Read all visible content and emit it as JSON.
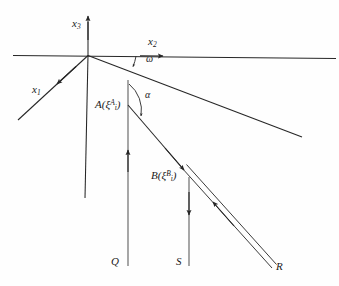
{
  "figure": {
    "background_color": "#fefefe",
    "line_color": "#262626",
    "text_color": "#1a1a1a"
  },
  "axes": [
    {
      "id": "x3",
      "name": "x3-axis",
      "label_base": "x",
      "label_sub": "3",
      "direction": "vertical-up",
      "label_x": 72,
      "label_y": 18,
      "arrow": "up"
    },
    {
      "id": "x2",
      "name": "x2-axis",
      "label_base": "x",
      "label_sub": "2",
      "direction": "horizontal-right",
      "label_x": 148,
      "label_y": 36,
      "arrow": "right"
    },
    {
      "id": "x1",
      "name": "x1-axis",
      "label_base": "x",
      "label_sub": "1",
      "direction": "down-left",
      "label_x": 32,
      "label_y": 84,
      "arrow": "down-left"
    }
  ],
  "angles": [
    {
      "id": "omega",
      "name": "omega-angle",
      "symbol": "ω",
      "label_x": 146,
      "label_y": 54,
      "between": "x2-axis and inclined-surface-line"
    },
    {
      "id": "alpha",
      "name": "alpha-angle",
      "symbol": "α",
      "label_x": 145,
      "label_y": 90,
      "between": "Q-ray and A-B-ray"
    }
  ],
  "points": [
    {
      "id": "A",
      "name": "point-A",
      "letter": "A",
      "xi_symbol": "ξ",
      "sub": "i",
      "sup": "A",
      "label_x": 95,
      "label_y": 99,
      "marker_x": 128,
      "marker_y": 105
    },
    {
      "id": "B",
      "name": "point-B",
      "letter": "B",
      "xi_symbol": "ξ",
      "sub": "i",
      "sup": "B",
      "label_x": 151,
      "label_y": 170,
      "marker_x": 182,
      "marker_y": 168
    }
  ],
  "rays": [
    {
      "id": "Q",
      "name": "ray-Q",
      "label": "Q",
      "label_x": 111,
      "label_y": 256,
      "style": "single-line",
      "arrow_direction": "up"
    },
    {
      "id": "S",
      "name": "ray-S",
      "label": "S",
      "label_x": 176,
      "label_y": 256,
      "style": "single-line",
      "arrow_direction": "down"
    },
    {
      "id": "R",
      "name": "ray-R",
      "label": "R",
      "label_x": 276,
      "label_y": 261,
      "style": "double-line",
      "arrow_direction": "up-left"
    }
  ]
}
